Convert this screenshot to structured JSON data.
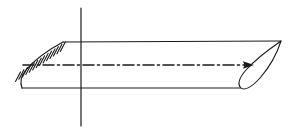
{
  "figure": {
    "domain": "Diagram",
    "kind": "engineering-line-drawing",
    "title": "",
    "caption": "",
    "background_color": "#ffffff",
    "line_color": "#1a1a1a",
    "canvas": {
      "width": 294,
      "height": 134
    },
    "labels": [],
    "annotations": [],
    "elements": {
      "vertical_axis": {
        "name": "vertical axis line",
        "description": "solid vertical reference line crossing the wing planform",
        "x": 81,
        "y_top": 8,
        "y_bottom": 126,
        "style": "solid",
        "color": "#1a1a1a"
      },
      "centerline": {
        "name": "chord centerline",
        "description": "dash-dot spanwise centerline running from the hatched root to the tip, terminating in a solid arrowhead",
        "x_start": 23,
        "x_end": 252,
        "y": 65,
        "style": "dash-dot",
        "dash_pattern": "11 3 2 3",
        "color": "#1a1a1a",
        "arrowhead": {
          "x": 252,
          "y": 65,
          "direction": "right",
          "filled": true
        }
      },
      "planform": {
        "name": "wing planform outline",
        "description": "upper and lower spanwise edges with rounded root and pointed tip",
        "top_edge": {
          "x_start": 63,
          "y_start": 42,
          "x_end": 281,
          "y_end": 41
        },
        "bottom_edge": {
          "x_start": 22,
          "y_start": 88,
          "x_end": 240,
          "y_end": 88
        },
        "root_curve": "rounded leading-edge fillet from (22,88) up to (63,42)",
        "tip_point": {
          "x": 281,
          "y": 41
        }
      },
      "tip_section": {
        "name": "airfoil tip cross-section",
        "description": "teardrop airfoil profile at the wing tip, sharp trailing point upper-right, rounded nose lower-left",
        "point_x": 281,
        "point_y": 41,
        "nose_x": 240,
        "nose_y": 87,
        "closed": true
      },
      "root_hatching": {
        "name": "fixed support hatching",
        "description": "short slanted hatch strokes along the swept leading edge indicating a fixed / clamped root",
        "count": 14,
        "line_start": {
          "x": 20,
          "y": 72
        },
        "line_end": {
          "x": 65,
          "y": 42
        },
        "stroke_length": 11,
        "stroke_angle_deg": -62
      }
    }
  }
}
